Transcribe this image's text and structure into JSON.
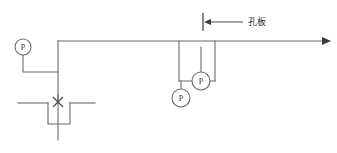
{
  "diagram": {
    "background_color": "#ffffff",
    "line_color": "#6b6b6b",
    "text_color": "#2e2e2e",
    "annotations": [
      {
        "id": "orifice-plate",
        "text": "孔板",
        "x": 248,
        "y": 22,
        "leader": {
          "x1": 207,
          "y1": 22,
          "x2": 243,
          "y2": 22
        },
        "arrow_points": "204,22 211,19 211,25",
        "tick": {
          "x": 203,
          "y1": 13,
          "y2": 31
        }
      }
    ],
    "gauges": [
      {
        "id": "pressure-gauge-left",
        "label": "P",
        "cx": 23,
        "cy": 47,
        "r": 8
      },
      {
        "id": "pressure-gauge-middle",
        "label": "P",
        "cx": 201,
        "cy": 81,
        "r": 9
      },
      {
        "id": "pressure-gauge-lower",
        "label": "P",
        "cx": 181,
        "cy": 98,
        "r": 9
      }
    ],
    "pipes": [
      {
        "id": "main-header-pipe",
        "path": "M 58 41 L 328 41"
      },
      {
        "id": "main-riser-pipe",
        "path": "M 58 41 L 58 103"
      },
      {
        "id": "left-gauge-branch",
        "path": "M 23 55 L 23 72 L 58 72"
      },
      {
        "id": "left-outlet-pipe",
        "path": "M 18 103 L 48 103"
      },
      {
        "id": "trap-loop-pipe",
        "path": "M 48 103 L 48 124 L 70 124 L 70 103"
      },
      {
        "id": "right-outlet-pipe",
        "path": "M 70 103 L 95 103"
      },
      {
        "id": "valve-stem-pipe",
        "path": "M 58 95 L 58 140"
      },
      {
        "id": "upstream-tap-pipe",
        "path": "M 179 41 L 179 81"
      },
      {
        "id": "downstream-tap-pipe",
        "path": "M 215 41 L 215 81"
      },
      {
        "id": "tap-crossover-pipe",
        "path": "M 179 81 L 215 81"
      },
      {
        "id": "middle-gauge-stem",
        "path": "M 201 47 L 201 72"
      },
      {
        "id": "lower-gauge-stem",
        "path": "M 181 81 L 181 89"
      }
    ],
    "valve": {
      "id": "valve-cross-marker",
      "cx": 58,
      "cy": 102,
      "size": 5
    },
    "flow_arrow": {
      "id": "flow-direction-arrow",
      "points": "331,41 322,37 322,45"
    }
  }
}
